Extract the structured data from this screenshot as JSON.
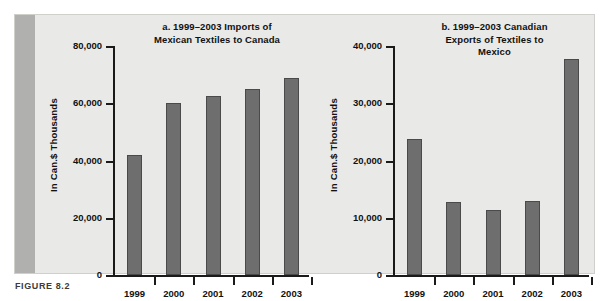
{
  "figure": {
    "caption": "FIGURE 8.2"
  },
  "chart_data": [
    {
      "id": "a",
      "type": "bar",
      "title": "a. 1999–2003 Imports of Mexican Textiles to Canada",
      "title_lines": [
        "a. 1999–2003 Imports of",
        "Mexican Textiles to Canada"
      ],
      "xlabel": "",
      "ylabel": "In Can.$ Thousands",
      "categories": [
        "1999",
        "2000",
        "2001",
        "2002",
        "2003"
      ],
      "values": [
        42000,
        60000,
        62400,
        65000,
        69000
      ],
      "ylim": [
        0,
        80000
      ],
      "yticks": [
        0,
        20000,
        40000,
        60000,
        80000
      ],
      "ytick_labels": [
        "0",
        "20,000",
        "40,000",
        "60,000",
        "80,000"
      ],
      "grid": false,
      "legend": false,
      "bar_color": "#6e6e6e"
    },
    {
      "id": "b",
      "type": "bar",
      "title": "b. 1999–2003 Canadian Exports of Textiles to Mexico",
      "title_lines": [
        "b. 1999–2003 Canadian",
        "Exports of Textiles to",
        "Mexico"
      ],
      "xlabel": "",
      "ylabel": "In Can.$ Thousands",
      "categories": [
        "1999",
        "2000",
        "2001",
        "2002",
        "2003"
      ],
      "values": [
        23700,
        12800,
        11300,
        12900,
        37800
      ],
      "ylim": [
        0,
        40000
      ],
      "yticks": [
        0,
        10000,
        20000,
        30000,
        40000
      ],
      "ytick_labels": [
        "0",
        "10,000",
        "20,000",
        "30,000",
        "40,000"
      ],
      "grid": false,
      "legend": false,
      "bar_color": "#6e6e6e"
    }
  ],
  "colors": {
    "panel_background": "#e9e9e7",
    "accent_band": "#b0b0ae",
    "bar_fill": "#6e6e6e",
    "bar_stroke": "#4a4a4a",
    "axis": "#1a1a1a",
    "text": "#111111",
    "caption_text": "#3b3b3b"
  }
}
